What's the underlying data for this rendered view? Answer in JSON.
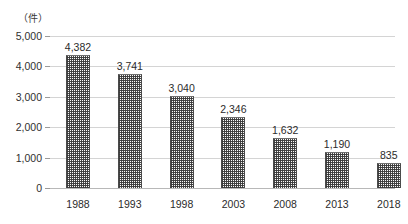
{
  "chart_data": {
    "type": "bar",
    "title": "",
    "subtitle": "",
    "xlabel": "",
    "ylabel": "",
    "unit_label": "（件）",
    "categories": [
      "1988",
      "1993",
      "1998",
      "2003",
      "2008",
      "2013",
      "2018"
    ],
    "values": [
      4382,
      3741,
      3040,
      2346,
      1632,
      1190,
      835
    ],
    "value_labels": [
      "4,382",
      "3,741",
      "3,040",
      "2,346",
      "1,632",
      "1,190",
      "835"
    ],
    "ylim": [
      0,
      5000
    ],
    "ytick_values": [
      0,
      1000,
      2000,
      3000,
      4000,
      5000
    ],
    "ytick_labels": [
      "0",
      "1,000",
      "2,000",
      "3,000",
      "4,000",
      "5,000"
    ],
    "grid": true,
    "legend": null,
    "series": [
      {
        "name": "",
        "values": [
          4382,
          3741,
          3040,
          2346,
          1632,
          1190,
          835
        ]
      }
    ],
    "colors": {
      "bar_fill": "#fafafa",
      "bar_pattern": "#4a4a4a",
      "bar_edge": "#4a4a4a",
      "gridline": "#d4d4d4",
      "axis": "#b8b8b8",
      "text": "#2b2b2b",
      "background": "#ffffff"
    }
  }
}
